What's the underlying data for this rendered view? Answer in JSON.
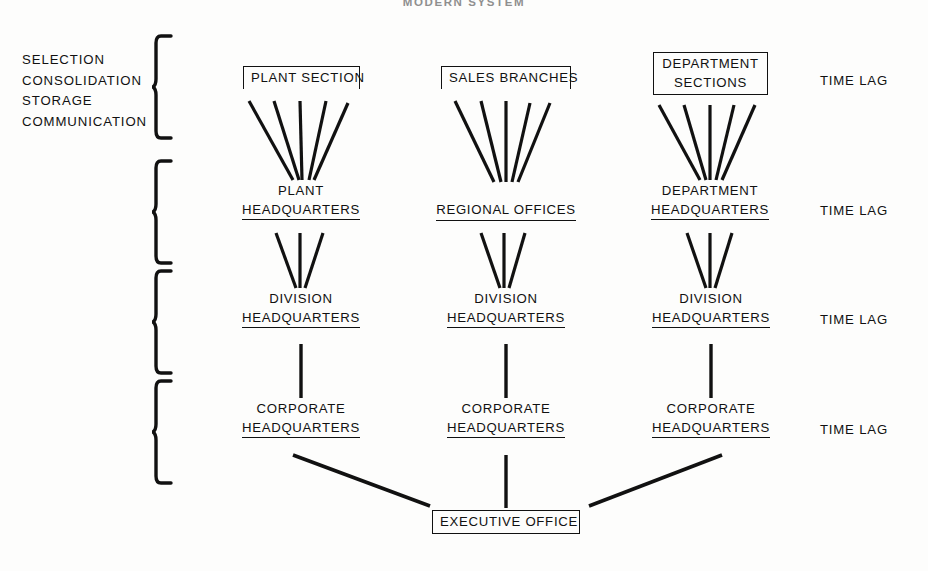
{
  "title": "MODERN SYSTEM",
  "process_labels": {
    "lines": [
      "SELECTION",
      "CONSOLIDATION",
      "STORAGE",
      "COMMUNICATION"
    ],
    "text": "SELECTION\nCONSOLIDATION\nSTORAGE\nCOMMUNICATION"
  },
  "colors": {
    "ink": "#111111",
    "paper": "#fdfdfc",
    "title": "#8f8f8f"
  },
  "columns": [
    {
      "id": "plant",
      "tiers": [
        {
          "label": "PLANT SECTION",
          "lines": [
            "PLANT SECTION"
          ],
          "style": "boxed"
        },
        {
          "label": "PLANT HEADQUARTERS",
          "lines": [
            "PLANT",
            "HEADQUARTERS"
          ],
          "style": "underlined"
        },
        {
          "label": "DIVISION HEADQUARTERS",
          "lines": [
            "DIVISION",
            "HEADQUARTERS"
          ],
          "style": "underlined"
        },
        {
          "label": "CORPORATE HEADQUARTERS",
          "lines": [
            "CORPORATE",
            "HEADQUARTERS"
          ],
          "style": "underlined"
        }
      ]
    },
    {
      "id": "sales",
      "tiers": [
        {
          "label": "SALES BRANCHES",
          "lines": [
            "SALES BRANCHES"
          ],
          "style": "boxed"
        },
        {
          "label": "REGIONAL OFFICES",
          "lines": [
            "REGIONAL OFFICES"
          ],
          "style": "underlined"
        },
        {
          "label": "DIVISION HEADQUARTERS",
          "lines": [
            "DIVISION",
            "HEADQUARTERS"
          ],
          "style": "underlined"
        },
        {
          "label": "CORPORATE HEADQUARTERS",
          "lines": [
            "CORPORATE",
            "HEADQUARTERS"
          ],
          "style": "underlined"
        }
      ]
    },
    {
      "id": "department",
      "tiers": [
        {
          "label": "DEPARTMENT SECTIONS",
          "lines": [
            "DEPARTMENT",
            "SECTIONS"
          ],
          "style": "boxed-full"
        },
        {
          "label": "DEPARTMENT HEADQUARTERS",
          "lines": [
            "DEPARTMENT",
            "HEADQUARTERS"
          ],
          "style": "underlined"
        },
        {
          "label": "DIVISION HEADQUARTERS",
          "lines": [
            "DIVISION",
            "HEADQUARTERS"
          ],
          "style": "underlined"
        },
        {
          "label": "CORPORATE HEADQUARTERS",
          "lines": [
            "CORPORATE",
            "HEADQUARTERS"
          ],
          "style": "underlined"
        }
      ]
    }
  ],
  "executive": {
    "label": "EXECUTIVE OFFICE"
  },
  "time_lags": [
    {
      "label": "TIME LAG"
    },
    {
      "label": "TIME LAG"
    },
    {
      "label": "TIME LAG"
    },
    {
      "label": "TIME LAG"
    }
  ]
}
